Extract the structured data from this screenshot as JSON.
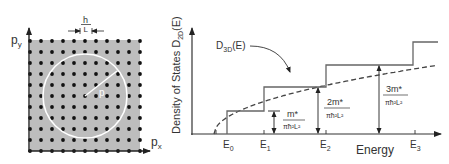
{
  "left_panel": {
    "y_axis_label": "p",
    "y_axis_sub": "y",
    "x_axis_label": "p",
    "x_axis_sub": "x",
    "spacing_numer": "h",
    "spacing_denom": "L",
    "radius_label": "p",
    "grid": {
      "cols": 11,
      "rows": 11,
      "x0": 30,
      "y0": 41,
      "step": 11
    },
    "circle": {
      "cx": 85,
      "cy": 96,
      "r": 42
    },
    "colors": {
      "fill": "#bdbdbd",
      "dot": "#111111",
      "circle": "#ffffff"
    }
  },
  "right_panel": {
    "y_axis_label": "Density of States D",
    "y_axis_sub": "2D",
    "y_axis_suffix": "(E)",
    "x_axis_label": "Energy",
    "curve_label": "D",
    "curve_sub": "3D",
    "curve_suffix": "(E)",
    "energy_levels": [
      {
        "label": "E",
        "sub": "0"
      },
      {
        "label": "E",
        "sub": "1"
      },
      {
        "label": "E",
        "sub": "2"
      },
      {
        "label": "E",
        "sub": "3"
      }
    ],
    "step_annotations": [
      {
        "numer": "m*",
        "denom": "πħ²L²"
      },
      {
        "numer": "2m*",
        "denom": "πħ²L²"
      },
      {
        "numer": "3m*",
        "denom": "πħ²L²"
      }
    ]
  }
}
